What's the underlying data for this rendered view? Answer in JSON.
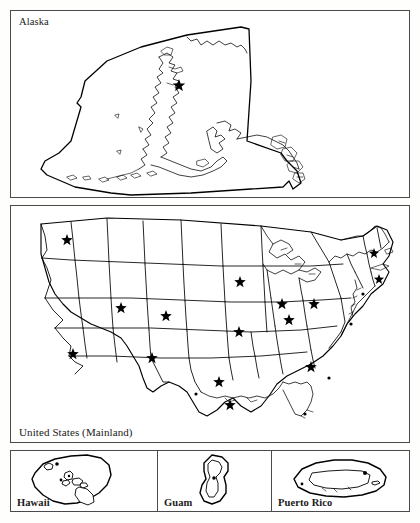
{
  "figure": {
    "background_color": "#fefefc",
    "line_color": "#000000",
    "border_color": "#4a4a4a",
    "panel_count": 5
  },
  "panels": [
    {
      "id": "alaska",
      "label": "Alaska",
      "label_position": "top-left",
      "marker_count": 1
    },
    {
      "id": "mainland",
      "label": "United States (Mainland)",
      "label_position": "bottom-left",
      "marker_count": 48
    },
    {
      "id": "hawaii",
      "label": "Hawaii",
      "label_position": "bottom-left",
      "marker_count": 1
    },
    {
      "id": "guam",
      "label": "Guam",
      "label_position": "bottom-left",
      "marker_count": 1
    },
    {
      "id": "puertorico",
      "label": "Puerto Rico",
      "label_position": "bottom-left",
      "marker_count": 1
    }
  ],
  "legend": {
    "marker_symbol": "star",
    "marker_meaning": "capital"
  }
}
